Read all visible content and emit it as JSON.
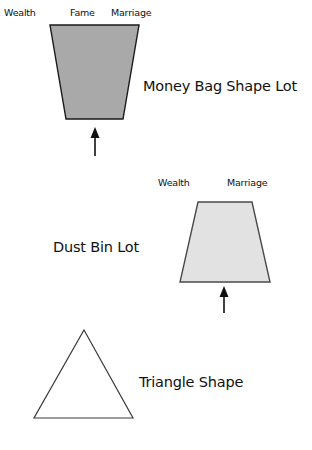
{
  "page": {
    "background_color": "#ffffff",
    "width": 312,
    "height": 450
  },
  "groups": [
    {
      "id": "money-bag-shape-lot",
      "caption": "Money Bag Shape Lot",
      "corner_labels": [
        "Wealth",
        "Fame",
        "Marriage"
      ],
      "shape": {
        "type": "trapezoid",
        "orientation": "wider-at-top",
        "fill_color": "#a9a9a9",
        "stroke_color": "#1a1a1a"
      },
      "arrow": {
        "direction": "up",
        "color": "#111111"
      }
    },
    {
      "id": "dust-bin-lot",
      "caption": "Dust Bin Lot",
      "corner_labels": [
        "Wealth",
        "Marriage"
      ],
      "shape": {
        "type": "trapezoid",
        "orientation": "wider-at-bottom",
        "fill_color": "#e2e2e2",
        "stroke_color": "#4a4a4a"
      },
      "arrow": {
        "direction": "up",
        "color": "#111111"
      }
    },
    {
      "id": "triangle-shape",
      "caption": "Triangle Shape",
      "corner_labels": [],
      "shape": {
        "type": "triangle",
        "orientation": "apex-up",
        "fill_color": "#ffffff",
        "stroke_color": "#3a3a3a"
      }
    }
  ],
  "labels": {
    "money_bag": {
      "wealth": "Wealth",
      "fame": "Fame",
      "marriage": "Marriage",
      "caption": "Money Bag Shape Lot"
    },
    "dust_bin": {
      "wealth": "Wealth",
      "marriage": "Marriage",
      "caption": "Dust Bin Lot"
    },
    "triangle": {
      "caption": "Triangle Shape"
    }
  }
}
